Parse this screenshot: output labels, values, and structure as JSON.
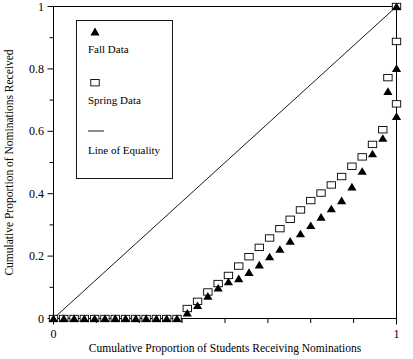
{
  "chart_data": {
    "type": "scatter",
    "title": "",
    "xlabel": "Cumulative Proportion of Students Receiving Nominations",
    "ylabel": "Cumulative Proportion of Nominations Received",
    "xlim": [
      0,
      1
    ],
    "ylim": [
      0,
      1
    ],
    "grid": false,
    "xticks": [
      0,
      1
    ],
    "xtick_labels": [
      "0",
      "1"
    ],
    "yticks": [
      0,
      0.2,
      0.4,
      0.6,
      0.8,
      1
    ],
    "ytick_labels": [
      "0",
      "0.2",
      "0.4",
      "0.6",
      "0.8",
      "1"
    ],
    "yminor_ticks": [
      0.1,
      0.3,
      0.5,
      0.7,
      0.9
    ],
    "xminor_ticks": [
      0.125,
      0.25,
      0.375,
      0.5,
      0.625,
      0.75,
      0.875
    ],
    "legend_position": "upper-left",
    "legend_entries": [
      {
        "label": "Fall Data",
        "marker": "filled-triangle"
      },
      {
        "label": "Spring Data",
        "marker": "open-square"
      },
      {
        "label": "Line of Equality",
        "marker": "line"
      }
    ],
    "x": [
      0.0,
      0.03,
      0.06,
      0.09,
      0.12,
      0.15,
      0.18,
      0.21,
      0.24,
      0.27,
      0.3,
      0.33,
      0.36,
      0.39,
      0.42,
      0.45,
      0.48,
      0.51,
      0.54,
      0.57,
      0.6,
      0.63,
      0.66,
      0.69,
      0.72,
      0.75,
      0.78,
      0.81,
      0.84,
      0.87,
      0.9,
      0.93,
      0.96,
      1.0
    ],
    "series": [
      {
        "name": "Fall Data",
        "marker": "filled-triangle",
        "color": "#000000",
        "values": [
          0.0,
          0.0,
          0.0,
          0.0,
          0.0,
          0.0,
          0.0,
          0.0,
          0.0,
          0.0,
          0.0,
          0.0,
          0.0,
          0.018,
          0.042,
          0.072,
          0.098,
          0.118,
          0.128,
          0.148,
          0.172,
          0.198,
          0.222,
          0.248,
          0.272,
          0.298,
          0.325,
          0.352,
          0.378,
          0.422,
          0.472,
          0.528,
          0.578,
          0.648
        ]
      },
      {
        "name": "Spring Data",
        "marker": "open-square",
        "color": "#000000",
        "values": [
          0.0,
          0.0,
          0.0,
          0.0,
          0.0,
          0.0,
          0.0,
          0.0,
          0.0,
          0.0,
          0.0,
          0.0,
          0.0,
          0.032,
          0.055,
          0.085,
          0.112,
          0.138,
          0.168,
          0.198,
          0.228,
          0.258,
          0.288,
          0.318,
          0.348,
          0.378,
          0.402,
          0.428,
          0.455,
          0.488,
          0.518,
          0.558,
          0.605,
          0.688
        ]
      }
    ],
    "extra_series": [
      {
        "name": "Fall Data",
        "x": [
          0.975,
          1.0
        ],
        "values": [
          0.728,
          0.802
        ]
      },
      {
        "name": "Spring Data",
        "x": [
          0.975,
          1.0
        ],
        "values": [
          0.772,
          0.888
        ]
      },
      {
        "name": "Fall Data",
        "x": [
          1.0
        ],
        "values": [
          1.0
        ]
      },
      {
        "name": "Spring Data",
        "x": [
          1.0
        ],
        "values": [
          1.0
        ]
      }
    ],
    "reference_line": {
      "name": "Line of Equality",
      "from": [
        0,
        0
      ],
      "to": [
        1,
        1
      ]
    }
  }
}
